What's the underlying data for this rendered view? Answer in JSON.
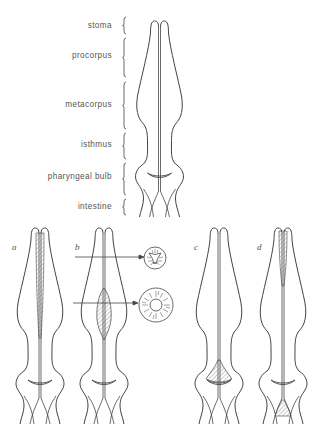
{
  "figure": {
    "main": {
      "regions": [
        {
          "label": "stoma",
          "y_top": 17,
          "y_bottom": 34
        },
        {
          "label": "procorpus",
          "y_top": 38,
          "y_bottom": 77
        },
        {
          "label": "metacorpus",
          "y_top": 82,
          "y_bottom": 129
        },
        {
          "label": "isthmus",
          "y_top": 133,
          "y_bottom": 159
        },
        {
          "label": "pharyngeal bulb",
          "y_top": 163,
          "y_bottom": 195
        },
        {
          "label": "intestine",
          "y_top": 199,
          "y_bottom": 215
        }
      ]
    },
    "panels": [
      {
        "label": "a",
        "description": "hatched lumen lining along procorpus and metacorpus"
      },
      {
        "label": "b",
        "description": "hatched swelling in metacorpus with cross-sections"
      },
      {
        "label": "c",
        "description": "hatched pharyngeal bulb valve"
      },
      {
        "label": "d",
        "description": "hatched procorpus lining and intestine start"
      }
    ],
    "cross_sections": [
      {
        "name": "procorpus-cross-section",
        "shape": "triradiate lumen"
      },
      {
        "name": "metacorpus-cross-section",
        "shape": "round lumen with radial muscles"
      }
    ]
  },
  "colors": {
    "stroke": "#444444",
    "hatch": "#666666",
    "background": "#ffffff"
  }
}
